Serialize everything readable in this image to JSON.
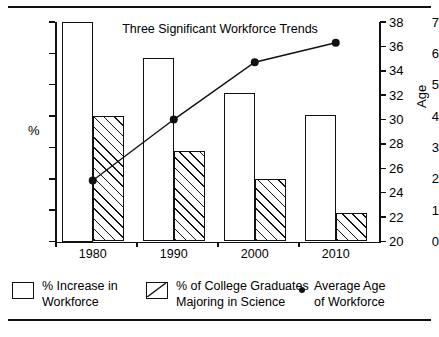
{
  "chart_data": {
    "type": "bar",
    "title": "Three Significant  Workforce Trends",
    "categories": [
      "1980",
      "1990",
      "2000",
      "2010"
    ],
    "xlabel": "",
    "ylabel": "%",
    "ylabel_secondary": "Age",
    "ylim": [
      0,
      7
    ],
    "ylim_secondary": [
      20,
      38
    ],
    "yticks": [
      "0",
      "1",
      "2",
      "3",
      "4",
      "5",
      "6",
      "7"
    ],
    "yticks_secondary": [
      "20",
      "22",
      "24",
      "26",
      "28",
      "30",
      "32",
      "34",
      "36",
      "38"
    ],
    "grid": false,
    "legend_position": "bottom",
    "series": [
      {
        "name": "% Increase in Workforce",
        "kind": "bar",
        "fill": "open",
        "axis": "left",
        "values": [
          7.0,
          5.85,
          4.75,
          4.05
        ]
      },
      {
        "name": "% of College Graduates Majoring in Science",
        "kind": "bar",
        "fill": "hatched",
        "axis": "left",
        "values": [
          4.0,
          2.9,
          2.0,
          0.9
        ]
      },
      {
        "name": "Average Age of Workforce",
        "kind": "line",
        "marker": "filled-circle",
        "axis": "right",
        "values": [
          25.0,
          30.0,
          34.7,
          36.3
        ]
      }
    ]
  },
  "legend": {
    "items": [
      {
        "swatch": "open-square",
        "line1": "% Increase in",
        "line2": "Workforce"
      },
      {
        "swatch": "hatched-square",
        "line1": "% of College  Graduates",
        "line2": "Majoring in Science"
      },
      {
        "swatch": "dot",
        "line1": "Average Age",
        "line2": "of Workforce"
      }
    ]
  }
}
